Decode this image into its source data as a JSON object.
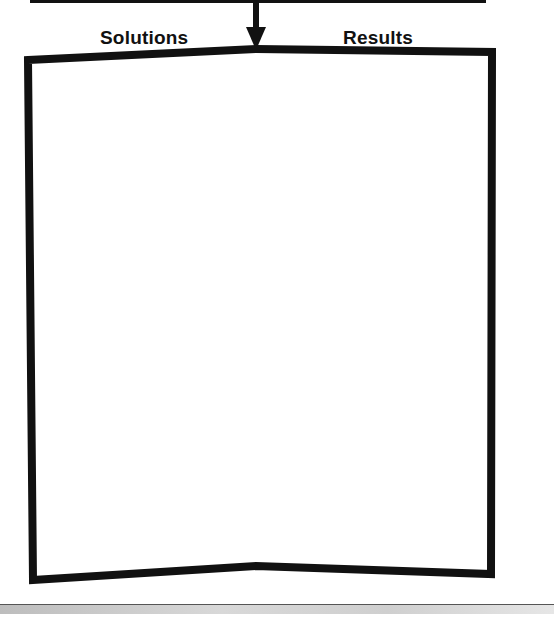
{
  "diagram": {
    "labels": {
      "left": "Solutions",
      "right": "Results"
    },
    "arrow": {
      "direction": "down",
      "icon": "arrow-down-icon"
    },
    "box": {
      "content": ""
    },
    "colors": {
      "stroke": "#111111",
      "background": "#ffffff"
    }
  }
}
